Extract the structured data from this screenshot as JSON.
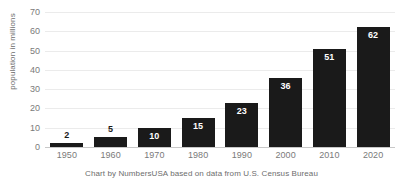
{
  "chart_data": {
    "type": "bar",
    "title": "",
    "subtitle": "",
    "xlabel": "",
    "ylabel": "population in millions",
    "categories": [
      "1950",
      "1960",
      "1970",
      "1980",
      "1990",
      "2000",
      "2010",
      "2020"
    ],
    "values": [
      2,
      5,
      10,
      15,
      23,
      36,
      51,
      62
    ],
    "value_labels": [
      "2",
      "5",
      "10",
      "15",
      "23",
      "36",
      "51",
      "62"
    ],
    "label_placement": [
      "outside",
      "outside",
      "inside",
      "inside",
      "inside",
      "inside",
      "inside",
      "inside"
    ],
    "ylim": [
      0,
      70
    ],
    "yticks": [
      0,
      10,
      20,
      30,
      40,
      50,
      60,
      70
    ],
    "ytick_labels": [
      "0",
      "10",
      "20",
      "30",
      "40",
      "50",
      "60",
      "70"
    ],
    "grid": true,
    "grid_axis": "y",
    "legend": false,
    "legend_position": "none",
    "series": [
      {
        "name": "population in millions",
        "values": [
          2,
          5,
          10,
          15,
          23,
          36,
          51,
          62
        ]
      }
    ],
    "annotations": [
      "Chart by NumbersUSA based on data from U.S. Census Bureau"
    ],
    "colors": {
      "bar": "#1a1a1a",
      "grid": "#ebebeb",
      "axis_line": "#c8c8c8",
      "tick_text": "#7a7a7a",
      "caption_text": "#6d6d6d",
      "value_label_inside": "#ffffff",
      "value_label_outside": "#1a1a1a",
      "background": "#ffffff"
    }
  },
  "caption": {
    "text": "Chart by NumbersUSA based on data from U.S. Census Bureau"
  }
}
